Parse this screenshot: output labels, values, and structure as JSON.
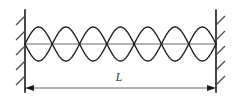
{
  "figure": {
    "kind": "physics-diagram",
    "width": 242,
    "height": 104,
    "background_color": "#ffffff"
  },
  "label": {
    "length_symbol": "L"
  },
  "colors": {
    "wave_stroke": "#1c1c1c",
    "wall_stroke": "#1a1a1a",
    "hatch_stroke": "#4a4a4a",
    "axis_stroke": "#9a9a9a",
    "dimension_stroke": "#9a9a9a",
    "arrow_fill": "#1a1a1a",
    "label_fill": "#333333"
  },
  "chart_data": {
    "type": "line",
    "xlabel": "L",
    "ylabel": "",
    "x_range": [
      25,
      216
    ],
    "y_center": 44,
    "amplitude": 17,
    "loops": 7,
    "harmonic": 7,
    "node_positions": [
      25,
      52.3,
      79.6,
      106.9,
      134.1,
      161.4,
      188.7,
      216
    ],
    "antinode_positions": [
      38.6,
      65.9,
      93.2,
      120.5,
      147.8,
      175.1,
      202.4
    ],
    "series": [
      {
        "name": "wave",
        "phase": "positive"
      },
      {
        "name": "wave-mirror",
        "phase": "negative"
      }
    ],
    "grid": false,
    "legend": null
  },
  "walls": {
    "left": {
      "x": 25,
      "y_top": 10,
      "y_bottom": 92,
      "hatch_side": "left",
      "hatch_count": 5
    },
    "right": {
      "x": 216,
      "y_top": 10,
      "y_bottom": 92,
      "hatch_side": "right",
      "hatch_count": 5
    }
  },
  "dimension": {
    "y": 88,
    "x_start": 25,
    "x_end": 216,
    "label_x": 119,
    "label_y": 81,
    "arrow_style": "outward"
  }
}
